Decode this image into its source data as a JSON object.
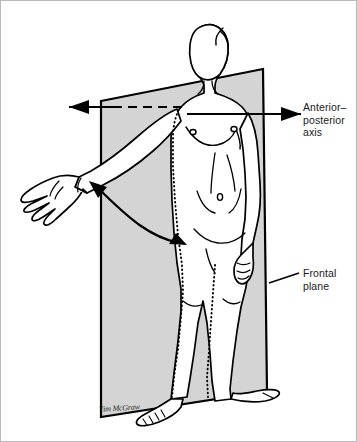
{
  "figure": {
    "kind": "anatomical-illustration",
    "background_color": "#ffffff",
    "border_color": "#b9b9b9",
    "ink_color": "#000000",
    "plane_fill_color": "#d4d4d4",
    "plane_edge_color": "#000000",
    "dotted_trace_color": "#000000",
    "labels": {
      "ap_axis": "Anterior–\nposterior\naxis",
      "frontal_plane": "Frontal\nplane"
    },
    "artist_signature": "Tim McGraw",
    "annotations": [
      {
        "name": "anterior-posterior-axis-arrow",
        "style": "single-headed arrow pointing left, dashed where hidden behind the frontal plane",
        "label": "Anterior–posterior axis"
      },
      {
        "name": "movement-arc-arrow",
        "style": "curved double-headed arrow from the abducted hand down to the thigh",
        "label": ""
      },
      {
        "name": "frontal-plane-leader",
        "style": "short leader line from label to the plane's right edge",
        "label": "Frontal plane"
      }
    ]
  }
}
